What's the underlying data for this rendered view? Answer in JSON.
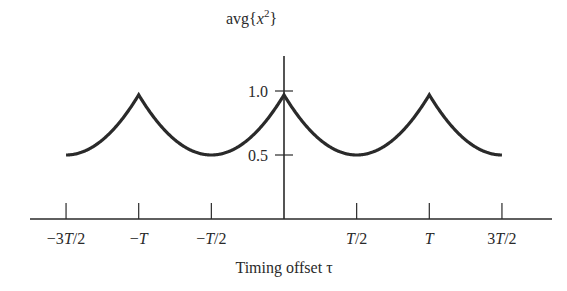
{
  "chart_data": {
    "type": "line",
    "title": "",
    "ylabel": "avg{x^2}",
    "xlabel": "Timing offset τ",
    "x_tick_labels": [
      "−3T/2",
      "−T",
      "−T/2",
      "T/2",
      "T",
      "3T/2"
    ],
    "x_tick_values_in_T": [
      -1.5,
      -1.0,
      -0.5,
      0.5,
      1.0,
      1.5
    ],
    "y_tick_labels": [
      "0.5",
      "1.0"
    ],
    "y_tick_values": [
      0.5,
      1.0
    ],
    "xlim_in_T": [
      -1.5,
      1.5
    ],
    "ylim": [
      0,
      1.2
    ],
    "grid": false,
    "legend": null,
    "series": [
      {
        "name": "avg{x^2}",
        "description": "Periodic with period T; cusp maxima of 1.0 at τ = kT, smooth minima of 0.5 at τ = (k+1/2)T",
        "x_in_T": [
          -1.5,
          -1.25,
          -1.0,
          -0.75,
          -0.5,
          -0.25,
          0.0,
          0.25,
          0.5,
          0.75,
          1.0,
          1.25,
          1.5
        ],
        "values": [
          0.5,
          0.625,
          1.0,
          0.625,
          0.5,
          0.625,
          1.0,
          0.625,
          0.5,
          0.625,
          1.0,
          0.625,
          0.5
        ]
      }
    ]
  },
  "labels": {
    "ylabel_prefix": "avg{",
    "ylabel_var": "x",
    "ylabel_exp": "2",
    "ylabel_suffix": "}",
    "xlabel": "Timing offset τ",
    "ytick_1": "1.0",
    "ytick_05": "0.5",
    "xticks": [
      "−3T/2",
      "−T",
      "−T/2",
      "T/2",
      "T",
      "3T/2"
    ]
  },
  "colors": {
    "ink": "#2a2a2a",
    "background": "#ffffff"
  }
}
